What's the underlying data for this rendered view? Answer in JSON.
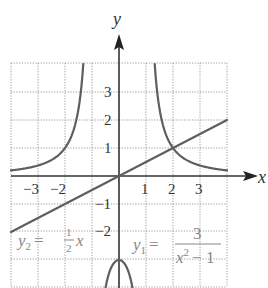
{
  "chart_data": {
    "type": "line",
    "title": "",
    "xlabel": "x",
    "ylabel": "y",
    "xlim": [
      -4,
      4
    ],
    "ylim": [
      -4,
      4
    ],
    "grid": true,
    "x_ticks": [
      -3,
      -2,
      1,
      2,
      3
    ],
    "y_ticks": [
      3,
      2,
      1,
      -1,
      -2
    ],
    "x_tick_labels": [
      "−3",
      "−2",
      "1",
      "2",
      "3"
    ],
    "y_tick_labels": [
      "3",
      "2",
      "1",
      "−1",
      "−2"
    ],
    "series": [
      {
        "name": "y1 = 3/(x^2 - 1)",
        "function": "3/(x^2-1)",
        "points": [
          [
            -4,
            0.2
          ],
          [
            -3,
            0.375
          ],
          [
            -2,
            1
          ],
          [
            -1.5,
            2.4
          ],
          [
            -1.32,
            4
          ],
          [
            -0.5,
            -4
          ],
          [
            0,
            -3
          ],
          [
            0.5,
            -4
          ],
          [
            1.32,
            4
          ],
          [
            1.5,
            2.4
          ],
          [
            2,
            1
          ],
          [
            3,
            0.375
          ],
          [
            4,
            0.2
          ]
        ]
      },
      {
        "name": "y2 = (1/2)x",
        "function": "0.5*x",
        "points": [
          [
            -4,
            -2
          ],
          [
            -2,
            -1
          ],
          [
            0,
            0
          ],
          [
            2,
            1
          ],
          [
            4,
            2
          ]
        ]
      }
    ],
    "annotations": [
      {
        "text": "y2 = 1/2 x",
        "position": "lower-left"
      },
      {
        "text": "y1 = 3/(x^2 - 1)",
        "position": "lower-right"
      },
      {
        "text": "intersection",
        "x": 2,
        "y": 1
      }
    ]
  },
  "labels": {
    "x_axis": "x",
    "y_axis": "y",
    "x_ticks": [
      "−3",
      "−2",
      "1",
      "2",
      "3"
    ],
    "y_ticks": [
      "3",
      "2",
      "1",
      "−1",
      "−2"
    ],
    "eq2": {
      "lhs": "y",
      "sub": "2",
      "eq": "=",
      "num": "1",
      "den": "2",
      "var": "x"
    },
    "eq1": {
      "lhs": "y",
      "sub": "1",
      "eq": "=",
      "num": "3",
      "den_var": "x",
      "den_exp": "2",
      "den_rest": "− 1"
    }
  },
  "colors": {
    "curve": "#5e5e5e",
    "axis": "#333333",
    "grid": "#9a9a9a",
    "annotation": "#888888"
  }
}
